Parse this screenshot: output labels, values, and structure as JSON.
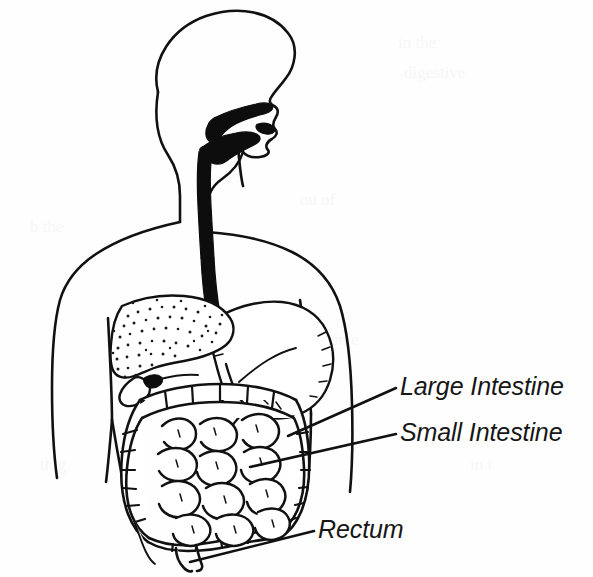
{
  "figure": {
    "background_color": "#fefefe",
    "ink_color": "#111111",
    "style": "black-and-white line drawing"
  },
  "labels": [
    {
      "id": "large-intestine",
      "text": "Large Intestine",
      "text_x": 400,
      "text_y": 395,
      "leader_from_x": 396,
      "leader_from_y": 388,
      "leader_to_x": 288,
      "leader_to_y": 436
    },
    {
      "id": "small-intestine",
      "text": "Small Intestine",
      "text_x": 400,
      "text_y": 441,
      "leader_from_x": 396,
      "leader_from_y": 434,
      "leader_to_x": 250,
      "leader_to_y": 467
    },
    {
      "id": "rectum",
      "text": "Rectum",
      "text_x": 318,
      "text_y": 538,
      "leader_from_x": 314,
      "leader_from_y": 531,
      "leader_to_x": 190,
      "leader_to_y": 562
    }
  ],
  "organs": [
    {
      "id": "head-profile",
      "name": "head and face profile",
      "shaded": false
    },
    {
      "id": "oral-cavity",
      "name": "oral cavity and pharynx",
      "shaded": true
    },
    {
      "id": "esophagus",
      "name": "esophagus",
      "shaded": true
    },
    {
      "id": "stomach",
      "name": "stomach",
      "shaded": false
    },
    {
      "id": "liver",
      "name": "liver",
      "shaded": false,
      "texture": "stipple"
    },
    {
      "id": "gallbladder",
      "name": "gallbladder",
      "shaded": false
    },
    {
      "id": "large-intestine",
      "name": "large intestine",
      "shaded": false,
      "texture": "haustra"
    },
    {
      "id": "small-intestine",
      "name": "small intestine",
      "shaded": false,
      "texture": "coiled loops"
    },
    {
      "id": "rectum",
      "name": "rectum",
      "shaded": false
    },
    {
      "id": "torso-outline",
      "name": "torso and arms outline",
      "shaded": false
    }
  ],
  "ghost_text": {
    "note": "faint show-through text from reverse of scanned page",
    "lines": [
      "",
      "",
      ""
    ]
  }
}
